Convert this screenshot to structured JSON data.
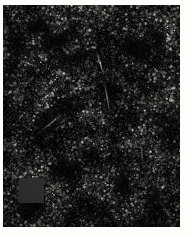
{
  "page": {
    "width": 194,
    "height": 237,
    "background_color": "#fdfdfc"
  },
  "figure": {
    "name": "fluorescence-micrograph",
    "modality": "fluorescence-microscopy",
    "channel": "grayscale",
    "frame": {
      "left": 3,
      "top": 5,
      "width": 177,
      "height": 222
    },
    "colors": {
      "background": "#050505",
      "deep_void": "#000000",
      "tissue_mid": "#3a3a3a",
      "nuclei_bright": "#e8e8e4",
      "nuclei_mid": "#9a9a96",
      "nuclei_dim": "#4e4e4c",
      "mask_patch": "#2e2e2e",
      "page": "#fdfdfc"
    },
    "mask_patch": {
      "name": "redacted-region",
      "left": 16,
      "top": 173,
      "width": 25,
      "height": 25,
      "color": "#2e2e2e"
    },
    "voids": [
      {
        "cx": 33,
        "cy": 22,
        "rx": 17,
        "ry": 9,
        "rot": -28,
        "strength": 0.95
      },
      {
        "cx": 52,
        "cy": 36,
        "rx": 22,
        "ry": 10,
        "rot": -22,
        "strength": 0.92
      },
      {
        "cx": 74,
        "cy": 52,
        "rx": 18,
        "ry": 8,
        "rot": -18,
        "strength": 0.8
      },
      {
        "cx": 14,
        "cy": 40,
        "rx": 13,
        "ry": 16,
        "rot": 12,
        "strength": 0.88
      },
      {
        "cx": 9,
        "cy": 62,
        "rx": 10,
        "ry": 13,
        "rot": 18,
        "strength": 0.7
      },
      {
        "cx": 131,
        "cy": 44,
        "rx": 20,
        "ry": 13,
        "rot": 24,
        "strength": 0.9
      },
      {
        "cx": 152,
        "cy": 30,
        "rx": 14,
        "ry": 9,
        "rot": 30,
        "strength": 0.72
      },
      {
        "cx": 106,
        "cy": 86,
        "rx": 11,
        "ry": 22,
        "rot": -8,
        "strength": 0.66
      },
      {
        "cx": 62,
        "cy": 104,
        "rx": 26,
        "ry": 9,
        "rot": -36,
        "strength": 0.72
      },
      {
        "cx": 40,
        "cy": 126,
        "rx": 20,
        "ry": 8,
        "rot": -40,
        "strength": 0.7
      },
      {
        "cx": 88,
        "cy": 150,
        "rx": 15,
        "ry": 10,
        "rot": 8,
        "strength": 0.68
      },
      {
        "cx": 60,
        "cy": 166,
        "rx": 17,
        "ry": 11,
        "rot": -12,
        "strength": 0.8
      },
      {
        "cx": 28,
        "cy": 200,
        "rx": 19,
        "ry": 12,
        "rot": -16,
        "strength": 0.88
      },
      {
        "cx": 120,
        "cy": 176,
        "rx": 9,
        "ry": 24,
        "rot": 4,
        "strength": 0.74
      },
      {
        "cx": 150,
        "cy": 196,
        "rx": 11,
        "ry": 20,
        "rot": -6,
        "strength": 0.7
      },
      {
        "cx": 168,
        "cy": 120,
        "rx": 10,
        "ry": 26,
        "rot": 6,
        "strength": 0.55
      },
      {
        "cx": 96,
        "cy": 206,
        "rx": 13,
        "ry": 10,
        "rot": 0,
        "strength": 0.62
      }
    ],
    "bright_streaks": [
      {
        "x": 97,
        "y": 58,
        "len": 26,
        "rot": 72,
        "w": 1.6,
        "alpha": 0.55
      },
      {
        "x": 104,
        "y": 92,
        "len": 34,
        "rot": 80,
        "w": 1.4,
        "alpha": 0.48
      },
      {
        "x": 48,
        "y": 118,
        "len": 30,
        "rot": -38,
        "w": 1.3,
        "alpha": 0.42
      },
      {
        "x": 24,
        "y": 58,
        "len": 18,
        "rot": 20,
        "w": 1.2,
        "alpha": 0.4
      },
      {
        "x": 139,
        "y": 150,
        "len": 22,
        "rot": 86,
        "w": 1.2,
        "alpha": 0.38
      }
    ]
  }
}
